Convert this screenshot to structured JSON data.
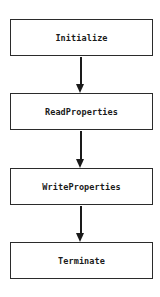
{
  "diagram": {
    "type": "flowchart",
    "direction": "top-to-bottom",
    "nodes": [
      {
        "id": "n1",
        "label": "Initialize"
      },
      {
        "id": "n2",
        "label": "ReadProperties"
      },
      {
        "id": "n3",
        "label": "WriteProperties"
      },
      {
        "id": "n4",
        "label": "Terminate"
      }
    ],
    "edges": [
      {
        "from": "n1",
        "to": "n2"
      },
      {
        "from": "n2",
        "to": "n3"
      },
      {
        "from": "n3",
        "to": "n4"
      }
    ],
    "colors": {
      "stroke": "#2b2b2b",
      "text": "#1a1a1a",
      "background": "#ffffff"
    }
  }
}
